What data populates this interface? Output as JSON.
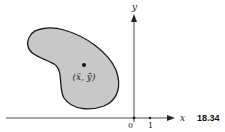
{
  "figure": {
    "number": "18.34",
    "axes": {
      "x_label": "x",
      "y_label": "y",
      "origin_label": "0",
      "tick_label": "1"
    },
    "region": {
      "fill_color": "#c8c8c8",
      "stroke_color": "#1a1a1a"
    },
    "centroid": {
      "label": "(x̄, ȳ)"
    }
  }
}
